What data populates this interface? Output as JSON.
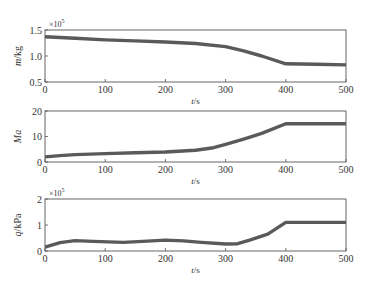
{
  "chart_data": [
    {
      "type": "line",
      "title": "",
      "xlabel": "t/s",
      "ylabel": "m/kg",
      "y_multiplier": "×10^5",
      "xlim": [
        0,
        500
      ],
      "ylim": [
        0.5,
        1.5
      ],
      "xticks": [
        0,
        100,
        200,
        300,
        400,
        500
      ],
      "yticks": [
        0.5,
        1.0,
        1.5
      ],
      "ytick_labels": [
        "0.5",
        "1.0",
        "1.5"
      ],
      "grid": false,
      "series": [
        {
          "name": "m",
          "x": [
            0,
            50,
            100,
            150,
            200,
            250,
            300,
            330,
            360,
            400,
            450,
            500
          ],
          "y": [
            1.37,
            1.34,
            1.31,
            1.29,
            1.27,
            1.24,
            1.18,
            1.1,
            1.0,
            0.85,
            0.84,
            0.83
          ]
        }
      ]
    },
    {
      "type": "line",
      "title": "",
      "xlabel": "t/s",
      "ylabel": "Ma",
      "xlim": [
        0,
        500
      ],
      "ylim": [
        0,
        20
      ],
      "xticks": [
        0,
        100,
        200,
        300,
        400,
        500
      ],
      "yticks": [
        0,
        10,
        20
      ],
      "ytick_labels": [
        "0",
        "10",
        "20"
      ],
      "grid": false,
      "series": [
        {
          "name": "Ma",
          "x": [
            0,
            25,
            50,
            100,
            150,
            200,
            250,
            280,
            300,
            330,
            360,
            400,
            450,
            500
          ],
          "y": [
            2.0,
            2.5,
            2.9,
            3.3,
            3.6,
            3.9,
            4.6,
            5.6,
            6.9,
            9.0,
            11.2,
            15.0,
            15.0,
            15.0
          ]
        }
      ]
    },
    {
      "type": "line",
      "title": "",
      "xlabel": "t/s",
      "ylabel": "q/kPa",
      "y_multiplier": "×10^5",
      "xlim": [
        0,
        500
      ],
      "ylim": [
        0,
        2
      ],
      "xticks": [
        0,
        100,
        200,
        300,
        400,
        500
      ],
      "yticks": [
        0,
        1,
        2
      ],
      "ytick_labels": [
        "0",
        "1",
        "2"
      ],
      "grid": false,
      "series": [
        {
          "name": "q",
          "x": [
            0,
            25,
            50,
            80,
            130,
            170,
            200,
            230,
            260,
            300,
            320,
            340,
            370,
            400,
            450,
            500
          ],
          "y": [
            0.15,
            0.32,
            0.4,
            0.37,
            0.33,
            0.38,
            0.42,
            0.39,
            0.33,
            0.27,
            0.28,
            0.42,
            0.65,
            1.1,
            1.1,
            1.1
          ]
        }
      ]
    }
  ]
}
